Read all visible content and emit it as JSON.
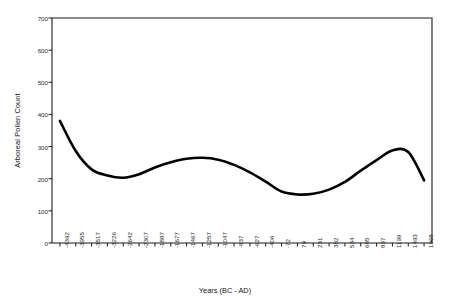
{
  "chart_data": {
    "type": "line",
    "title": "",
    "xlabel": "Years (BC - AD)",
    "ylabel": "Arboreal Pollen Count",
    "ylim": [
      0,
      700
    ],
    "yticks": [
      0,
      100,
      200,
      300,
      400,
      500,
      600,
      700
    ],
    "ytick_labels": [
      "0",
      "100",
      "200",
      "300",
      "400",
      "500",
      "600",
      "700"
    ],
    "grid": false,
    "legend": "none",
    "categories": [
      "-4392",
      "-3955",
      "-3517",
      "-3226",
      "-2642",
      "-2307",
      "-1887",
      "-1677",
      "-1467",
      "-1257",
      "-1047",
      "-837",
      "-627",
      "-406",
      "-72",
      "79",
      "231",
      "382",
      "534",
      "685",
      "837",
      "1199",
      "1493",
      "1968"
    ],
    "series": [
      {
        "name": "Arboreal Pollen Count",
        "color": "#000000",
        "values": [
          380,
          286,
          229,
          210,
          203,
          214,
          235,
          251,
          262,
          265,
          259,
          243,
          220,
          191,
          160,
          151,
          153,
          166,
          190,
          225,
          258,
          288,
          283,
          195
        ]
      }
    ]
  },
  "axes": {
    "frame_color": "#1a1a1a",
    "line_color": "#000000"
  }
}
